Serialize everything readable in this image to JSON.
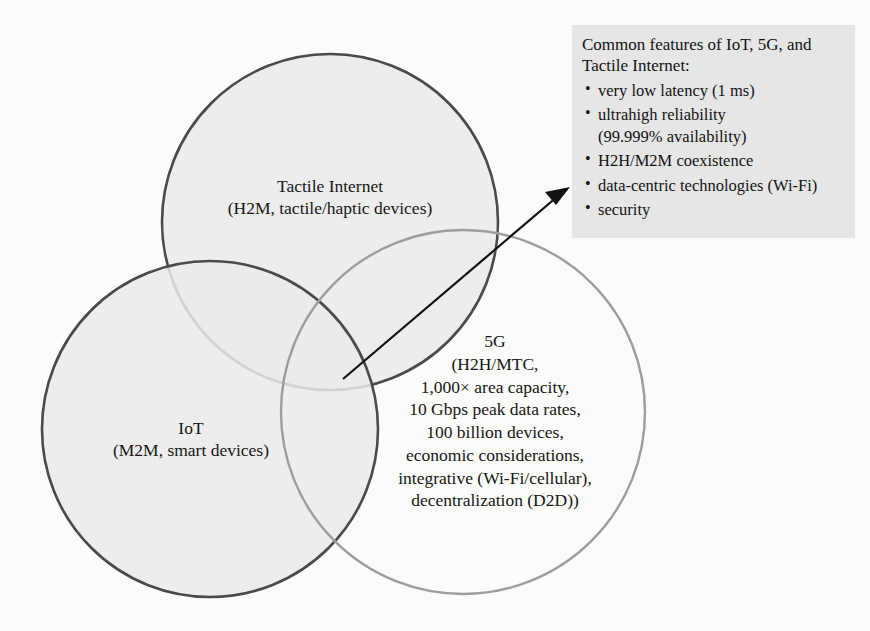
{
  "diagram": {
    "circles": {
      "tactile": {
        "label_line1": "Tactile Internet",
        "label_line2": "(H2M, tactile/haptic devices)",
        "stroke_color": "#4a4a4a",
        "fill_color": "#eaeaea"
      },
      "iot": {
        "label_line1": "IoT",
        "label_line2": "(M2M, smart devices)",
        "stroke_color": "#4a4a4a",
        "fill_color": "#eaeaea"
      },
      "fiveg": {
        "lines": [
          "5G",
          "(H2H/MTC,",
          "1,000× area capacity,",
          "10 Gbps peak data rates,",
          "100 billion devices,",
          "economic considerations,",
          "integrative (Wi-Fi/cellular),",
          "decentralization (D2D))"
        ],
        "stroke_color": "#9a9a9a",
        "fill_color": "#ffffff"
      }
    },
    "arrow": {
      "color": "#111111",
      "name": "callout-arrow"
    }
  },
  "callout": {
    "title_line1": "Common features of IoT, 5G,",
    "title_line2": "and Tactile Internet:",
    "background_color": "#e6e6e6",
    "bullet_glyph": "•",
    "items": [
      {
        "text": "very low latency (1 ms)",
        "sub": ""
      },
      {
        "text": "ultrahigh reliability",
        "sub": "(99.999% availability)"
      },
      {
        "text": "H2H/M2M coexistence",
        "sub": ""
      },
      {
        "text": "data-centric technologies (Wi-Fi)",
        "sub": ""
      },
      {
        "text": "security",
        "sub": ""
      }
    ]
  }
}
